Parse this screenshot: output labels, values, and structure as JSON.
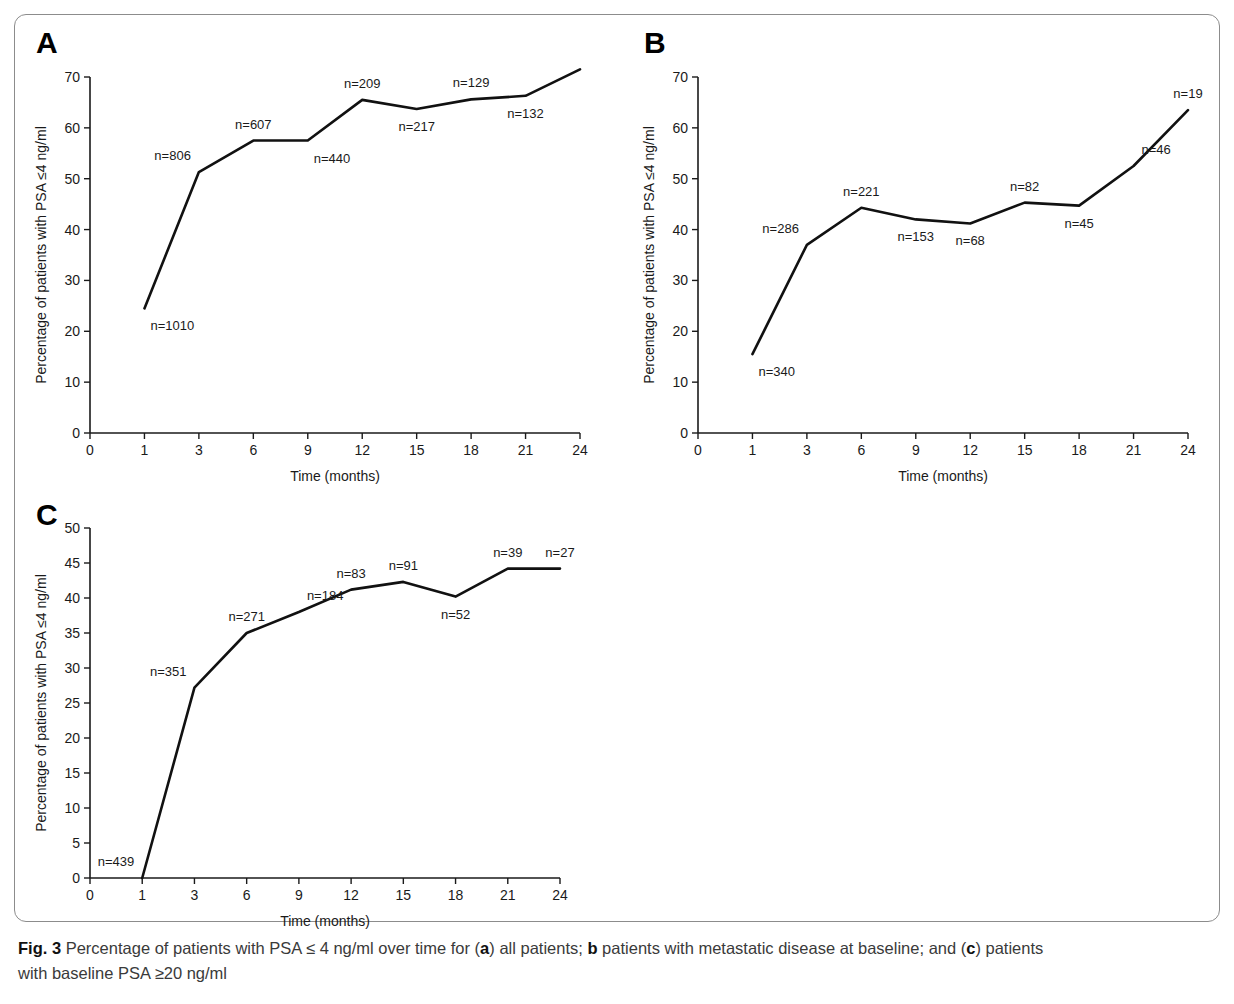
{
  "figure": {
    "caption_label": "Fig. 3",
    "caption_text": " Percentage of patients with PSA ≤ 4 ng/ml over time for (a) all patients; b patients with metastatic disease at baseline; and (c) patients with baseline PSA ≥20 ng/ml",
    "caption_line1_pre": " Percentage of patients with PSA ≤ 4 ng/ml over time for (",
    "caption_a": "a",
    "caption_line1_mid": ") all patients; ",
    "caption_b": "b",
    "caption_line1_mid2": " patients with metastatic disease at baseline; and (",
    "caption_c": "c",
    "caption_line1_end": ") patients",
    "caption_line2": "with baseline PSA ≥20 ng/ml"
  },
  "colors": {
    "line": "#111111",
    "axis": "#1a1a1a",
    "frame": "#8c8c8c",
    "caption_text": "#3a3a3a",
    "background": "#ffffff"
  },
  "panels": [
    {
      "letter": "A",
      "id": "panel-a"
    },
    {
      "letter": "B",
      "id": "panel-b"
    },
    {
      "letter": "C",
      "id": "panel-c"
    }
  ],
  "chart_data": [
    {
      "type": "line",
      "panel": "A",
      "title": "",
      "subtitle": "all patients",
      "xlabel": "Time (months)",
      "ylabel": "Percentage of patients with PSA ≤4 ng/ml",
      "x": [
        1,
        3,
        6,
        9,
        12,
        15,
        18,
        21,
        24
      ],
      "xtick_labels": [
        "0",
        "1",
        "3",
        "6",
        "9",
        "12",
        "15",
        "18",
        "21",
        "24"
      ],
      "xtick_values": [
        0,
        1,
        3,
        6,
        9,
        12,
        15,
        18,
        21,
        24
      ],
      "x_spacing": "categorical-equal",
      "values": [
        24.5,
        51.3,
        57.5,
        57.5,
        65.5,
        63.7,
        65.6,
        66.3,
        71.5
      ],
      "point_labels": [
        "n=1010",
        "n=806",
        "n=607",
        "n=440",
        "n=209",
        "n=217",
        "n=129",
        "n=132",
        ""
      ],
      "label_placement": [
        "below-right",
        "above-left",
        "above",
        "below-right",
        "above",
        "below",
        "above",
        "below",
        "none"
      ],
      "ylim": [
        0,
        70
      ],
      "ytick_values": [
        0,
        10,
        20,
        30,
        40,
        50,
        60,
        70
      ],
      "ytick_labels": [
        "0",
        "10",
        "20",
        "30",
        "40",
        "50",
        "60",
        "70"
      ],
      "grid": false,
      "legend": "none"
    },
    {
      "type": "line",
      "panel": "B",
      "title": "",
      "subtitle": "patients with metastatic disease at baseline",
      "xlabel": "Time (months)",
      "ylabel": "Percentage of patients with PSA ≤4 ng/ml",
      "x": [
        1,
        3,
        6,
        9,
        12,
        15,
        18,
        21,
        24
      ],
      "xtick_labels": [
        "0",
        "1",
        "3",
        "6",
        "9",
        "12",
        "15",
        "18",
        "21",
        "24"
      ],
      "xtick_values": [
        0,
        1,
        3,
        6,
        9,
        12,
        15,
        18,
        21,
        24
      ],
      "x_spacing": "categorical-equal",
      "values": [
        15.5,
        37.0,
        44.3,
        42.0,
        41.2,
        45.3,
        44.7,
        52.5,
        63.5
      ],
      "point_labels": [
        "n=340",
        "n=286",
        "n=221",
        "n=153",
        "n=68",
        "n=82",
        "n=45",
        "n=46",
        "n=19"
      ],
      "label_placement": [
        "below-right",
        "above-left",
        "above",
        "below",
        "below",
        "above",
        "below",
        "above-right",
        "above"
      ],
      "ylim": [
        0,
        70
      ],
      "ytick_values": [
        0,
        10,
        20,
        30,
        40,
        50,
        60,
        70
      ],
      "ytick_labels": [
        "0",
        "10",
        "20",
        "30",
        "40",
        "50",
        "60",
        "70"
      ],
      "grid": false,
      "legend": "none"
    },
    {
      "type": "line",
      "panel": "C",
      "title": "",
      "subtitle": "patients with baseline PSA ≥20 ng/ml",
      "xlabel": "Time (months)",
      "ylabel": "Percentage of patients with PSA ≤4 ng/ml",
      "x": [
        1,
        3,
        6,
        9,
        12,
        15,
        18,
        21,
        24
      ],
      "xtick_labels": [
        "0",
        "1",
        "3",
        "6",
        "9",
        "12",
        "15",
        "18",
        "21",
        "24"
      ],
      "xtick_values": [
        0,
        1,
        3,
        6,
        9,
        12,
        15,
        18,
        21,
        24
      ],
      "x_spacing": "categorical-equal",
      "values": [
        0.0,
        27.2,
        35.0,
        38.0,
        41.2,
        42.3,
        40.2,
        44.2,
        44.2
      ],
      "point_labels": [
        "n=439",
        "n=351",
        "n=271",
        "n=184",
        "n=83",
        "n=91",
        "n=52",
        "n=39",
        "n=27"
      ],
      "label_placement": [
        "above-left",
        "above-left",
        "above",
        "above-right",
        "above",
        "above",
        "below",
        "above",
        "above"
      ],
      "ylim": [
        0,
        50
      ],
      "ytick_values": [
        0,
        5,
        10,
        15,
        20,
        25,
        30,
        35,
        40,
        45,
        50
      ],
      "ytick_labels": [
        "0",
        "5",
        "10",
        "15",
        "20",
        "25",
        "30",
        "35",
        "40",
        "45",
        "50"
      ],
      "grid": false,
      "legend": "none"
    }
  ]
}
